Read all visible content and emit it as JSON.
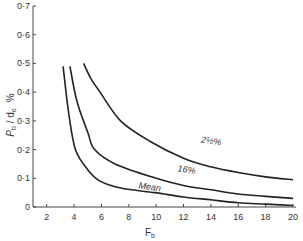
{
  "chart_data": {
    "type": "line",
    "title": "",
    "xlabel": "F_b",
    "ylabel": "P_b / d_o %",
    "xlim": [
      1,
      20
    ],
    "ylim": [
      0,
      0.7
    ],
    "grid": false,
    "legend": "inline curve labels",
    "x_ticks": [
      2,
      4,
      6,
      8,
      10,
      12,
      14,
      16,
      18,
      20
    ],
    "x_tick_labels": [
      "2",
      "4",
      "6",
      "8",
      "10",
      "12",
      "14",
      "16",
      "18",
      "20"
    ],
    "y_ticks": [
      0,
      0.1,
      0.2,
      0.3,
      0.4,
      0.5,
      0.6,
      0.7
    ],
    "y_tick_labels": [
      "0",
      "0·1",
      "0·2",
      "0·3",
      "0·4",
      "0·5",
      "0·6",
      "0·7"
    ],
    "series": [
      {
        "name": "2½%",
        "label_pos": [
          14,
          0.22
        ],
        "x": [
          4.7,
          5.2,
          5.9,
          7.4,
          9.5,
          12,
          14,
          16,
          18,
          20
        ],
        "y": [
          0.5,
          0.45,
          0.4,
          0.3,
          0.23,
          0.17,
          0.14,
          0.12,
          0.105,
          0.095
        ]
      },
      {
        "name": "16%",
        "label_pos": [
          12.2,
          0.12
        ],
        "x": [
          3.7,
          4.2,
          5.0,
          5.5,
          7.0,
          10,
          12,
          14,
          16,
          18,
          20
        ],
        "y": [
          0.49,
          0.37,
          0.26,
          0.2,
          0.15,
          0.1,
          0.075,
          0.06,
          0.045,
          0.037,
          0.03
        ]
      },
      {
        "name": "Mean",
        "label_pos": [
          9.5,
          0.06
        ],
        "x": [
          3.2,
          3.6,
          4.1,
          5.0,
          5.9,
          7.5,
          9.9,
          12,
          14,
          16,
          18,
          20
        ],
        "y": [
          0.49,
          0.33,
          0.2,
          0.13,
          0.09,
          0.065,
          0.05,
          0.035,
          0.025,
          0.015,
          0.01,
          0.005
        ]
      }
    ]
  },
  "axes": {
    "x_title": "F",
    "x_title_sub": "b",
    "y_title_p": "P",
    "y_title_p_sub": "b",
    "y_title_slash": " / d",
    "y_title_d_sub": "o",
    "y_title_unit": "%"
  }
}
